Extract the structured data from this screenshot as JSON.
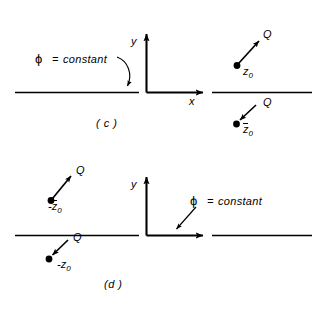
{
  "figure": {
    "background_color": "#ffffff",
    "ink_color": "#000000",
    "panels": [
      {
        "id": "c",
        "caption": "( c )",
        "axes": {
          "y_label": "y",
          "x_label": "x"
        },
        "boundary_annotation": {
          "phi_symbol": "ϕ",
          "equals": "=",
          "value": "constant",
          "arrow_style": "curved"
        },
        "charges": [
          {
            "position": "upper-right",
            "charge_label": "Q",
            "coord_prefix": "",
            "coord_symbol": "z",
            "coord_subscript": "0",
            "coord_overbar": false,
            "coord_text": "z0",
            "arrow_direction": "up-right"
          },
          {
            "position": "lower-right",
            "charge_label": "Q",
            "coord_prefix": "",
            "coord_symbol": "z",
            "coord_subscript": "0",
            "coord_overbar": true,
            "coord_text": "z̅0",
            "arrow_direction": "down-left"
          }
        ]
      },
      {
        "id": "d",
        "caption": "(d )",
        "axes": {
          "y_label": "y",
          "x_label": ""
        },
        "boundary_annotation": {
          "phi_symbol": "ϕ",
          "equals": "=",
          "value": "constant",
          "arrow_style": "straight"
        },
        "charges": [
          {
            "position": "upper-left",
            "charge_label": "Q",
            "coord_prefix": "-",
            "coord_symbol": "z",
            "coord_subscript": "0",
            "coord_overbar": true,
            "coord_text": "-z̅0",
            "arrow_direction": "up-right"
          },
          {
            "position": "lower-left",
            "charge_label": "Q",
            "coord_prefix": "-",
            "coord_symbol": "z",
            "coord_subscript": "0",
            "coord_overbar": false,
            "coord_text": "-z0",
            "arrow_direction": "down-left"
          }
        ]
      }
    ]
  }
}
